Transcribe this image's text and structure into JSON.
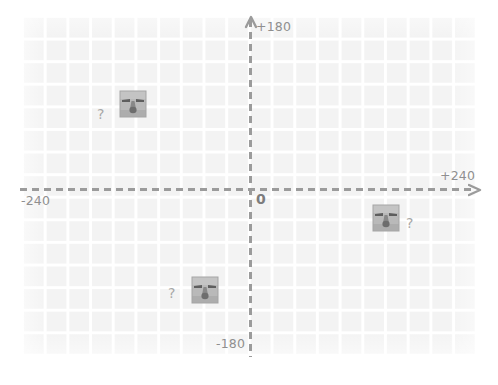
{
  "scene": {
    "title": "coordinate-plane-with-unknown-sprite-positions",
    "background_color": "#ffffff",
    "grid": {
      "cell_color": "#ededed",
      "line_color": "#ffffff",
      "cell_size_px": 22.7,
      "columns": 20,
      "rows": 15
    },
    "axes": {
      "color": "#9b9b9b",
      "style": "dashed-with-arrowheads",
      "x_label_positive": "+240",
      "x_label_negative": "-240",
      "y_label_positive": "+180",
      "y_label_negative": "-180",
      "origin_label": "0",
      "x_range": [
        -240,
        240
      ],
      "y_range": [
        -180,
        180
      ]
    },
    "sprites": [
      {
        "id": "sprite-1",
        "name": "stone-face-sprite",
        "marker": "?",
        "marker_side": "left",
        "approx_coords": [
          -128,
          81
        ]
      },
      {
        "id": "sprite-2",
        "name": "stone-face-sprite",
        "marker": "?",
        "marker_side": "left",
        "approx_coords": [
          -48,
          -101
        ]
      },
      {
        "id": "sprite-3",
        "name": "stone-face-sprite",
        "marker": "?",
        "marker_side": "right",
        "approx_coords": [
          139,
          -22
        ]
      }
    ]
  },
  "colors": {
    "grid_cell": "#ededed",
    "grid_line": "#ffffff",
    "axis": "#9b9b9b",
    "label_text": "#8f8f8f",
    "question_mark": "#a8a8a8",
    "sprite_body": "#b4b4b4",
    "sprite_dark": "#6a6a6a"
  }
}
